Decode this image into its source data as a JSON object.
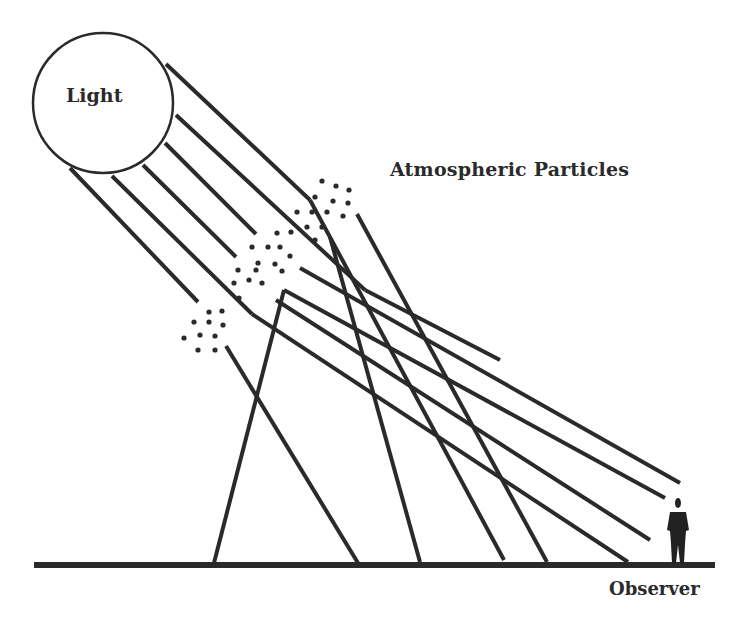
{
  "labels": {
    "light": "Light",
    "particles": "Atmospheric Particles",
    "observer": "Observer"
  },
  "colors": {
    "ink": "#2a2a2a",
    "background": "#ffffff"
  },
  "light_source": {
    "cx": 103,
    "cy": 103,
    "r": 70
  },
  "ground": {
    "x1": 34,
    "y1": 565,
    "x2": 715,
    "y2": 565,
    "width": 6
  },
  "incident_rays": [
    {
      "x1": 166,
      "y1": 64,
      "x2": 310,
      "y2": 200
    },
    {
      "x1": 176,
      "y1": 115,
      "x2": 365,
      "y2": 290
    },
    {
      "x1": 165,
      "y1": 143,
      "x2": 256,
      "y2": 234
    },
    {
      "x1": 143,
      "y1": 165,
      "x2": 236,
      "y2": 257
    },
    {
      "x1": 112,
      "y1": 176,
      "x2": 252,
      "y2": 314
    },
    {
      "x1": 70,
      "y1": 168,
      "x2": 198,
      "y2": 302
    },
    {
      "x1": 310,
      "y1": 200,
      "x2": 504,
      "y2": 560
    }
  ],
  "scattered_rays": [
    {
      "x1": 357,
      "y1": 214,
      "x2": 547,
      "y2": 562
    },
    {
      "x1": 330,
      "y1": 237,
      "x2": 420,
      "y2": 562
    },
    {
      "x1": 300,
      "y1": 268,
      "x2": 680,
      "y2": 483
    },
    {
      "x1": 284,
      "y1": 290,
      "x2": 665,
      "y2": 498
    },
    {
      "x1": 276,
      "y1": 300,
      "x2": 650,
      "y2": 540
    },
    {
      "x1": 284,
      "y1": 290,
      "x2": 214,
      "y2": 563
    },
    {
      "x1": 226,
      "y1": 346,
      "x2": 358,
      "y2": 563
    },
    {
      "x1": 252,
      "y1": 314,
      "x2": 628,
      "y2": 562
    },
    {
      "x1": 365,
      "y1": 290,
      "x2": 500,
      "y2": 360
    }
  ],
  "particle_clusters": [
    {
      "dots": [
        [
          322,
          181
        ],
        [
          336,
          186
        ],
        [
          349,
          190
        ],
        [
          315,
          197
        ],
        [
          333,
          201
        ],
        [
          348,
          203
        ],
        [
          297,
          212
        ],
        [
          312,
          212
        ],
        [
          327,
          212
        ],
        [
          343,
          216
        ],
        [
          307,
          227
        ],
        [
          322,
          227
        ],
        [
          291,
          232
        ],
        [
          315,
          240
        ]
      ]
    },
    {
      "dots": [
        [
          277,
          233
        ],
        [
          252,
          247
        ],
        [
          268,
          247
        ],
        [
          280,
          247
        ],
        [
          290,
          256
        ],
        [
          258,
          263
        ],
        [
          275,
          264
        ],
        [
          238,
          270
        ],
        [
          256,
          270
        ],
        [
          282,
          271
        ],
        [
          234,
          283
        ],
        [
          249,
          280
        ],
        [
          262,
          283
        ],
        [
          239,
          298
        ]
      ]
    },
    {
      "dots": [
        [
          209,
          312
        ],
        [
          222,
          311
        ],
        [
          194,
          322
        ],
        [
          209,
          322
        ],
        [
          223,
          325
        ],
        [
          184,
          338
        ],
        [
          200,
          335
        ],
        [
          215,
          336
        ],
        [
          198,
          350
        ],
        [
          215,
          350
        ]
      ]
    }
  ],
  "observer_figure": {
    "x": 678,
    "y": 498
  }
}
